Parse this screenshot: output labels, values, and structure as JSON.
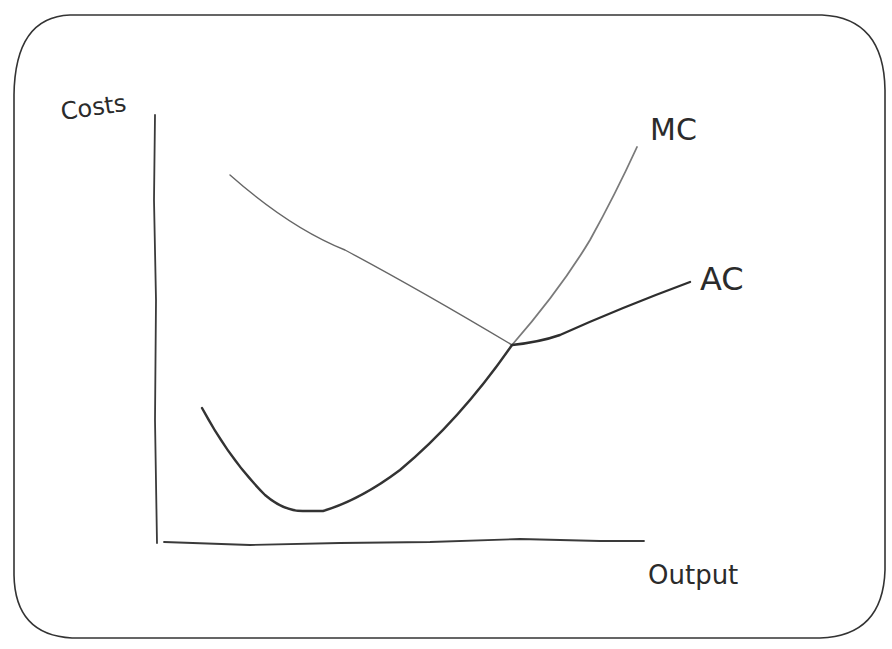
{
  "diagram": {
    "type": "hand-drawn cost curves",
    "axes": {
      "y_label": "Costs",
      "x_label": "Output"
    },
    "curves": [
      {
        "id": "mc",
        "label": "MC",
        "description": "Dark U-shaped stroke from upper-left descending to a minimum near the bottom, then rising through the intersection; continues as a lighter steep stroke to the upper right where the MC label sits"
      },
      {
        "id": "ac",
        "label": "AC",
        "description": "Lighter straight stroke descending from upper-left to the intersection; continues as a darker, flatter rising stroke to the right where the AC label sits"
      }
    ],
    "intersection": {
      "description": "Curves cross at a single point in the middle-right of the plot"
    },
    "frame": "rounded rectangle border",
    "colors": {
      "ink_dark": "#2e2e2e",
      "ink_light": "#777777",
      "frame": "#333333",
      "background": "#ffffff"
    }
  }
}
